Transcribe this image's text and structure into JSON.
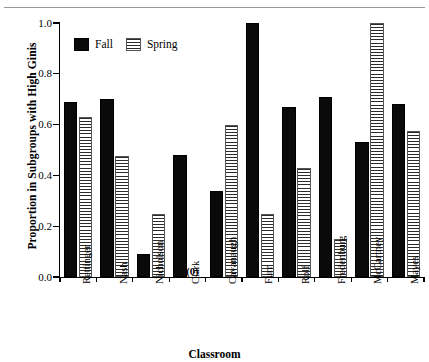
{
  "chart_data": {
    "type": "bar",
    "title": "",
    "xlabel": "Classroom",
    "ylabel": "Proportion in Subgroups with High Ginis",
    "ylim": [
      0.0,
      1.0
    ],
    "yticks": [
      "0.0",
      "0.2",
      "0.4",
      "0.6",
      "0.8",
      "1.0"
    ],
    "ytick_values": [
      0.0,
      0.2,
      0.4,
      0.6,
      0.8,
      1.0
    ],
    "grid": false,
    "legend_position": "top-left-inside",
    "categories": [
      "Rettinger",
      "Nash",
      "Nicholson",
      "Clark",
      "Cavanaugh",
      "Furr",
      "Rolf",
      "Fredenburg",
      "McCartney",
      "Mayes"
    ],
    "series": [
      {
        "name": "Fall",
        "color": "#0a0a0a",
        "fill": "solid",
        "values": [
          0.69,
          0.7,
          0.09,
          0.48,
          0.34,
          1.0,
          0.67,
          0.71,
          0.53,
          0.68
        ]
      },
      {
        "name": "Spring",
        "color": "#2b2b2b",
        "fill": "horizontal-stripes",
        "values": [
          0.63,
          0.475,
          0.25,
          0.0,
          0.6,
          0.25,
          0.43,
          0.15,
          1.0,
          0.575
        ]
      }
    ],
    "annotations": [
      {
        "text": "(0)",
        "category": "Clark",
        "series": "Spring",
        "value": 0.0
      }
    ]
  }
}
